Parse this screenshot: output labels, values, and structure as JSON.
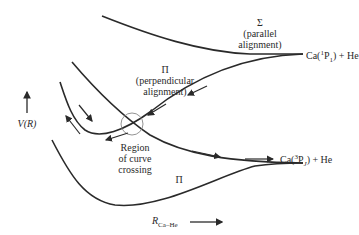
{
  "diagram": {
    "title": "",
    "axes": {
      "y_label": "V(R)",
      "x_label": "R",
      "x_label_subscript": "Ca–He"
    },
    "states": {
      "sigma": {
        "symbol": "Σ",
        "note": "(parallel",
        "note2": "alignment)"
      },
      "pi_upper": {
        "symbol": "Π",
        "note": "(perpendicular",
        "note2": "alignment)"
      },
      "pi_lower": {
        "symbol": "Π"
      }
    },
    "asymptotes": {
      "upper": {
        "prefix": "Ca(",
        "sup": "1",
        "term": "P",
        "sub": "1",
        "suffix": ") + He"
      },
      "lower": {
        "prefix": "Ca(",
        "sup": "3",
        "term": "P",
        "sub": "J",
        "suffix": ") + He"
      }
    },
    "crossing": {
      "line1": "Region",
      "line2": "of curve",
      "line3": "crossing"
    },
    "colors": {
      "line": "#2a2a2a",
      "circle": "#888888",
      "background": "#ffffff"
    }
  }
}
